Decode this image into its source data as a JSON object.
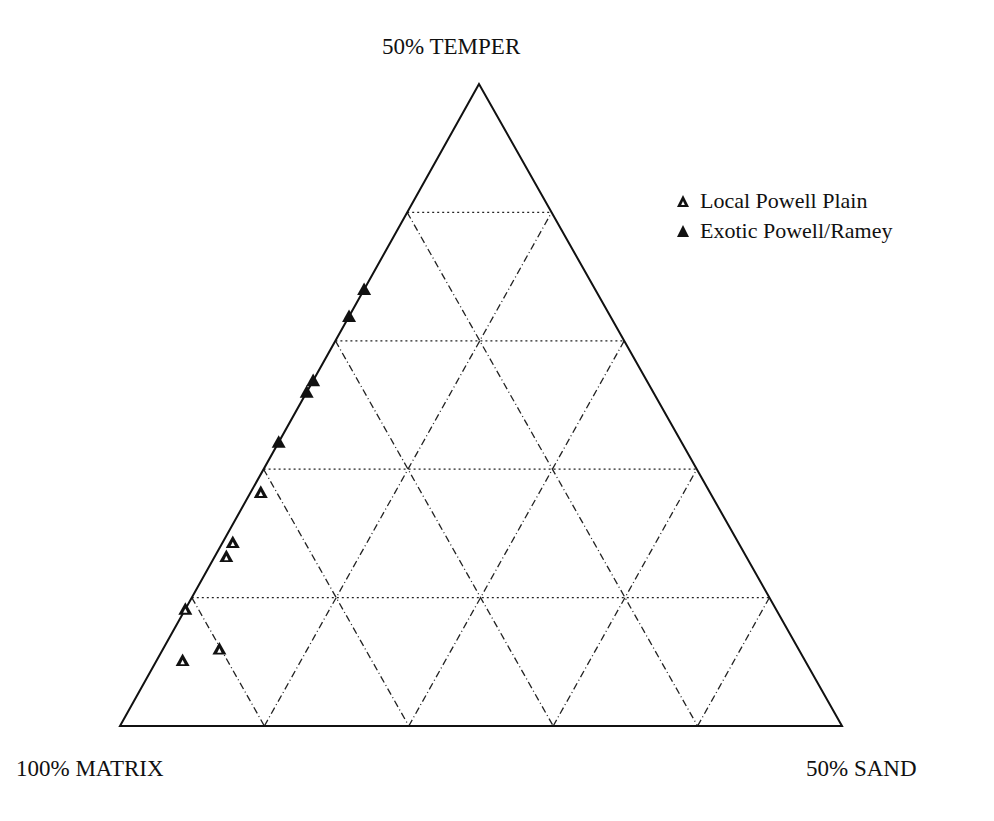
{
  "chart_data": {
    "type": "scatter",
    "subtype": "ternary",
    "title": "",
    "vertices": {
      "top": "50% TEMPER",
      "left": "100% MATRIX",
      "right": "50% SAND"
    },
    "axes": {
      "temper_range": [
        0,
        50
      ],
      "sand_range": [
        0,
        50
      ],
      "matrix_range": [
        50,
        100
      ],
      "grid_divisions": 5,
      "grid": true
    },
    "legend_position": "upper-right",
    "series": [
      {
        "name": "Local Powell Plain",
        "marker": "open-triangle",
        "color": "#111111",
        "points": [
          {
            "temper": 18.2,
            "sand": 0.7,
            "matrix": 81.1
          },
          {
            "temper": 14.3,
            "sand": 0.7,
            "matrix": 85.0
          },
          {
            "temper": 13.2,
            "sand": 0.8,
            "matrix": 86.0
          },
          {
            "temper": 9.1,
            "sand": 0.0,
            "matrix": 90.9
          },
          {
            "temper": 6.0,
            "sand": 3.9,
            "matrix": 90.1
          },
          {
            "temper": 5.1,
            "sand": 1.8,
            "matrix": 93.1
          }
        ]
      },
      {
        "name": "Exotic Powell/Ramey",
        "marker": "filled-triangle",
        "color": "#111111",
        "points": [
          {
            "temper": 34.0,
            "sand": 0.0,
            "matrix": 66.0
          },
          {
            "temper": 31.9,
            "sand": 0.0,
            "matrix": 68.1
          },
          {
            "temper": 26.9,
            "sand": 0.0,
            "matrix": 73.1
          },
          {
            "temper": 26.0,
            "sand": 0.0,
            "matrix": 74.0
          },
          {
            "temper": 22.1,
            "sand": 0.0,
            "matrix": 77.9
          }
        ]
      }
    ]
  },
  "labels": {
    "top": "50% TEMPER",
    "left": "100% MATRIX",
    "right": "50% SAND"
  },
  "legend": [
    {
      "label": "Local Powell Plain",
      "marker": "open-triangle"
    },
    {
      "label": "Exotic Powell/Ramey",
      "marker": "filled-triangle"
    }
  ]
}
